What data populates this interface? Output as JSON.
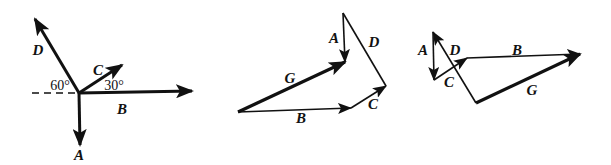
{
  "figure": {
    "colors": {
      "ink": "#111111",
      "background": "#ffffff"
    },
    "diagrams": [
      {
        "id": "vectors-from-origin",
        "labels": {
          "D": "D",
          "C": "C",
          "B": "B",
          "A": "A",
          "angle_D": "60°",
          "angle_C": "30°"
        }
      },
      {
        "id": "polygon-sum-1",
        "labels": {
          "A": "A",
          "D": "D",
          "G": "G",
          "B": "B",
          "C": "C"
        }
      },
      {
        "id": "polygon-sum-2",
        "labels": {
          "A": "A",
          "D": "D",
          "C": "C",
          "B": "B",
          "G": "G"
        }
      }
    ]
  }
}
